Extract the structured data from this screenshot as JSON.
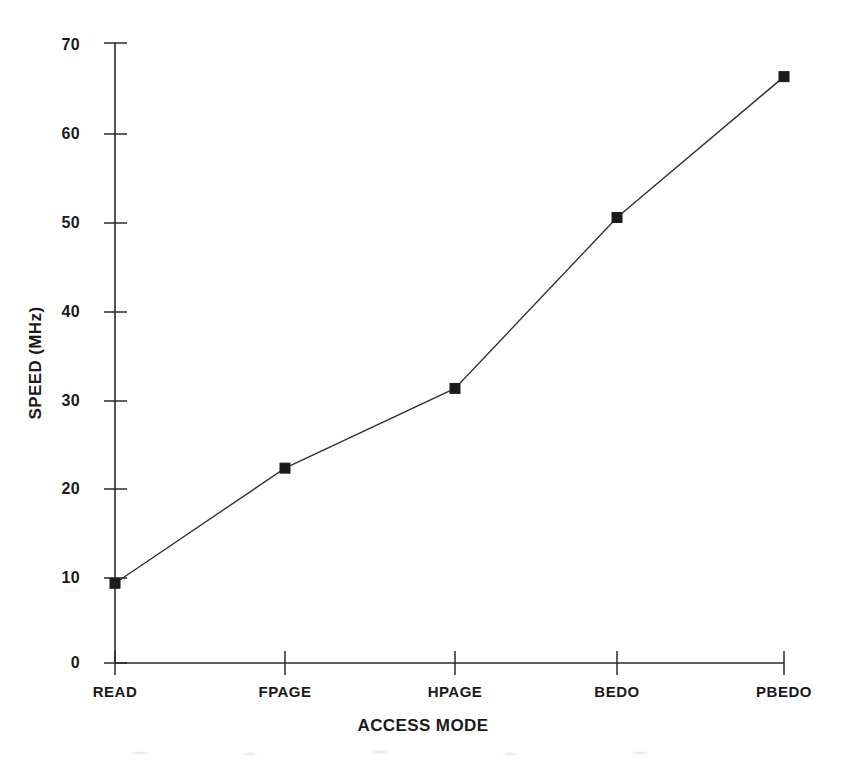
{
  "chart_data": {
    "type": "line",
    "title": "",
    "xlabel": "ACCESS MODE",
    "ylabel": "SPEED (MHz)",
    "categories": [
      "READ",
      "FPAGE",
      "HPAGE",
      "BEDO",
      "PBEDO"
    ],
    "values": [
      9,
      22,
      31,
      50.3,
      66.2
    ],
    "series": [
      {
        "name": "SPEED (MHz)",
        "values": [
          9,
          22,
          31,
          50.3,
          66.2
        ]
      }
    ],
    "ylim": [
      0,
      70
    ],
    "y_ticks": [
      0,
      10,
      20,
      30,
      40,
      50,
      60,
      70
    ],
    "y_tick_labels": [
      "0",
      "10",
      "20",
      "30",
      "40",
      "50",
      "60",
      "70"
    ],
    "x_tick_labels": [
      "READ",
      "FPAGE",
      "HPAGE",
      "BEDO",
      "PBEDO"
    ],
    "grid": false,
    "legend": "none",
    "marker": "square",
    "line_color": "#333333",
    "marker_color": "#1c1c1c",
    "axis_color": "#2b2b2b",
    "background_color": "#ffffff"
  }
}
